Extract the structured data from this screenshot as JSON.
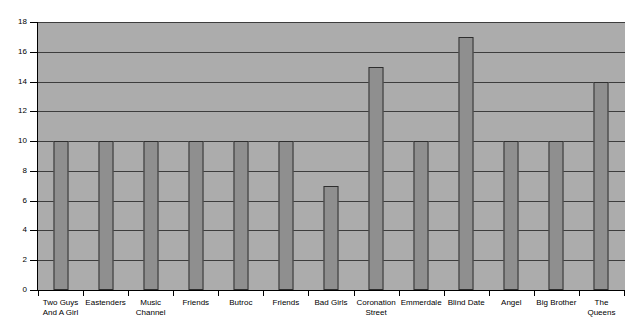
{
  "chart_data": {
    "type": "bar",
    "title": "",
    "xlabel": "",
    "ylabel": "",
    "ylim": [
      0,
      18
    ],
    "grid": true,
    "legend": "none",
    "y_ticks": [
      0,
      2,
      4,
      6,
      8,
      10,
      12,
      14,
      16,
      18
    ],
    "categories": [
      "Two Guys And A Girl",
      "Eastenders",
      "Music Channel",
      "Friends",
      "Butroc",
      "Friends",
      "Bad Girls",
      "Coronation Street",
      "Emmerdale",
      "Blind Date",
      "Angel",
      "Big Brother",
      "The Queens"
    ],
    "category_lines": [
      [
        "Two Guys",
        "And A Girl"
      ],
      [
        "Eastenders"
      ],
      [
        "Music",
        "Channel"
      ],
      [
        "Friends"
      ],
      [
        "Butroc"
      ],
      [
        "Friends"
      ],
      [
        "Bad Girls"
      ],
      [
        "Coronation",
        "Street"
      ],
      [
        "Emmerdale"
      ],
      [
        "Blind Date"
      ],
      [
        "Angel"
      ],
      [
        "Big Brother"
      ],
      [
        "The",
        "Queens"
      ]
    ],
    "values": [
      10,
      10,
      10,
      10,
      10,
      10,
      7,
      15,
      10,
      17,
      10,
      10,
      14
    ]
  },
  "colors": {
    "plot_background": "#acacac",
    "bar_fill": "#8f8f8f",
    "bar_border": "#2e2e2e",
    "gridline": "#3d3d3d",
    "axis": "#000000",
    "page_background": "#ffffff",
    "text": "#000000"
  }
}
